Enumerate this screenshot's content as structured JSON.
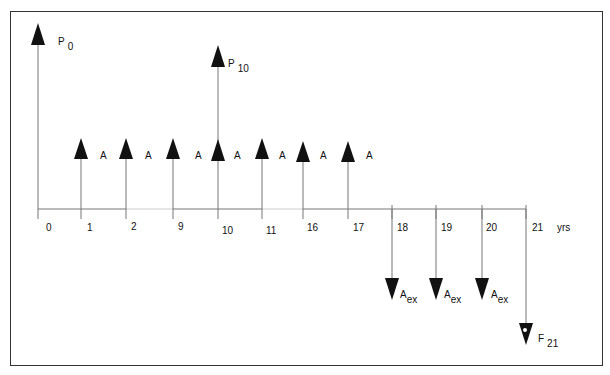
{
  "diagram": {
    "type": "cash-flow-timeline",
    "axis": {
      "unit_label": "yrs",
      "ticks": [
        "0",
        "1",
        "2",
        "9",
        "10",
        "11",
        "16",
        "17",
        "18",
        "19",
        "20",
        "21"
      ],
      "breaks": [
        "2-9",
        "11-16"
      ]
    },
    "inflows": [
      {
        "label": "P",
        "sub": "0",
        "period": "0"
      },
      {
        "label": "P",
        "sub": "10",
        "period": "10"
      },
      {
        "label": "A",
        "sub": "",
        "period": "1"
      },
      {
        "label": "A",
        "sub": "",
        "period": "2"
      },
      {
        "label": "A",
        "sub": "",
        "period": "9"
      },
      {
        "label": "A",
        "sub": "",
        "period": "10"
      },
      {
        "label": "A",
        "sub": "",
        "period": "11"
      },
      {
        "label": "A",
        "sub": "",
        "period": "16"
      },
      {
        "label": "A",
        "sub": "",
        "period": "17"
      }
    ],
    "outflows": [
      {
        "label": "A",
        "sub": "ex",
        "period": "18"
      },
      {
        "label": "A",
        "sub": "ex",
        "period": "19"
      },
      {
        "label": "A",
        "sub": "ex",
        "period": "20"
      },
      {
        "label": "F",
        "sub": "21",
        "period": "21"
      }
    ]
  }
}
